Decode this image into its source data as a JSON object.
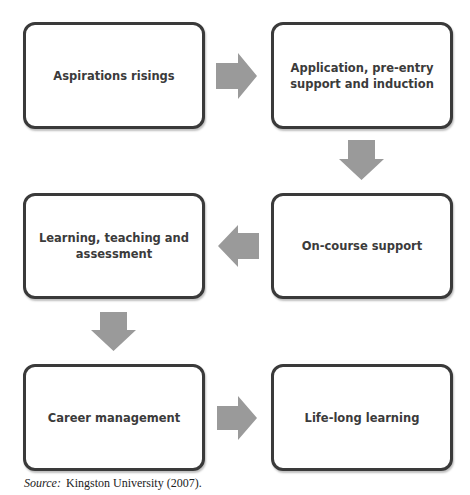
{
  "diagram": {
    "type": "flowchart",
    "arrow_color": "#9a9a9a",
    "border_color": "#3a3a3a",
    "steps": [
      {
        "id": 1,
        "label": "Aspirations risings"
      },
      {
        "id": 2,
        "label": "Application, pre-entry support and induction"
      },
      {
        "id": 3,
        "label": "On-course support"
      },
      {
        "id": 4,
        "label": "Learning, teaching and assessment"
      },
      {
        "id": 5,
        "label": "Career management"
      },
      {
        "id": 6,
        "label": "Life-long learning"
      }
    ],
    "arrows": [
      {
        "from": 1,
        "to": 2,
        "direction": "right"
      },
      {
        "from": 2,
        "to": 3,
        "direction": "down"
      },
      {
        "from": 3,
        "to": 4,
        "direction": "left"
      },
      {
        "from": 4,
        "to": 5,
        "direction": "down"
      },
      {
        "from": 5,
        "to": 6,
        "direction": "right"
      }
    ]
  },
  "source": {
    "label": "Source:",
    "text": "Kingston University (2007)."
  }
}
